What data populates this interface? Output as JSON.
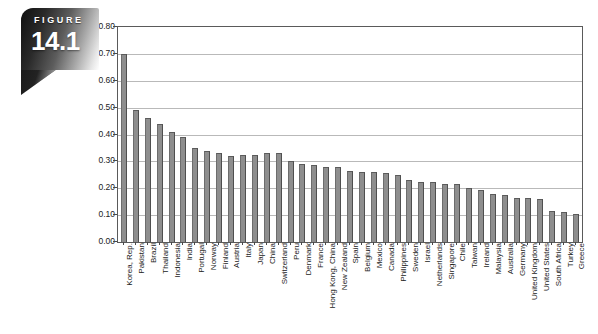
{
  "figure": {
    "label": "FIGURE",
    "number": "14.1"
  },
  "chart_data": {
    "type": "bar",
    "title": "",
    "subtitle": "",
    "xlabel": "",
    "ylabel": "",
    "ylim": [
      0.0,
      0.8
    ],
    "ytick_step": 0.1,
    "ytick_labels": [
      "0.80",
      "0.70",
      "0.60",
      "0.50",
      "0.40",
      "0.30",
      "0.20",
      "0.10",
      "0.00"
    ],
    "ytick_values": [
      0.8,
      0.7,
      0.6,
      0.5,
      0.4,
      0.3,
      0.2,
      0.1,
      0.0
    ],
    "grid": true,
    "grid_axis": "y",
    "legend": false,
    "legend_position": "none",
    "bar_color": "#8e8e8e",
    "bar_edge_color": "#4f4f4f",
    "gridline_color": "#b9b9b9",
    "frame_color": "#5a5a5a",
    "categories": [
      "Korea, Rep.",
      "Pakistan",
      "Brazil",
      "Thailand",
      "Indonesia",
      "India",
      "Portugal",
      "Norway",
      "Finland",
      "Austria",
      "Italy",
      "Japan",
      "China",
      "Switzerland",
      "Peru",
      "Denmark",
      "France",
      "Hong Kong, China",
      "New Zealand",
      "Spain",
      "Belgium",
      "Mexico",
      "Canada",
      "Philippines",
      "Sweden",
      "Israel",
      "Netherlands",
      "Singapore",
      "Chile",
      "Taiwan",
      "Ireland",
      "Malaysia",
      "Australia",
      "Germany",
      "United Kingdom",
      "United States",
      "South Africa",
      "Turkey",
      "Greece"
    ],
    "values": [
      0.7,
      0.49,
      0.46,
      0.44,
      0.41,
      0.39,
      0.35,
      0.34,
      0.33,
      0.32,
      0.325,
      0.325,
      0.33,
      0.33,
      0.3,
      0.29,
      0.285,
      0.28,
      0.28,
      0.265,
      0.26,
      0.26,
      0.255,
      0.25,
      0.23,
      0.225,
      0.225,
      0.215,
      0.215,
      0.2,
      0.195,
      0.18,
      0.175,
      0.165,
      0.165,
      0.16,
      0.115,
      0.11,
      0.105
    ]
  }
}
